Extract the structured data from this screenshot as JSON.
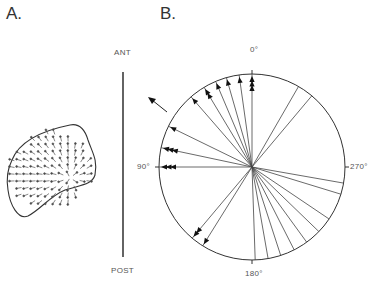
{
  "panels": {
    "a": {
      "label": "A."
    },
    "b": {
      "label": "B."
    }
  },
  "axis": {
    "anterior_label": "ANT",
    "posterior_label": "POST"
  },
  "polar": {
    "labels": {
      "top": "0°",
      "left": "90°",
      "bottom": "180°",
      "right": "270°"
    },
    "center": [
      252,
      167
    ],
    "radius": 93,
    "arrowed_directions_deg": [
      {
        "angle": 0,
        "heads": 3
      },
      {
        "angle": 8,
        "heads": 1
      },
      {
        "angle": 16,
        "heads": 1
      },
      {
        "angle": 23,
        "heads": 1
      },
      {
        "angle": 31,
        "heads": 2
      },
      {
        "angle": 41,
        "heads": 1
      },
      {
        "angle": 64,
        "heads": 1
      },
      {
        "angle": 78,
        "heads": 3
      },
      {
        "angle": 90,
        "heads": 3
      },
      {
        "angle": 140,
        "heads": 2
      },
      {
        "angle": 148,
        "heads": 1
      }
    ],
    "plain_directions_deg": [
      182,
      190,
      198,
      207,
      216,
      226,
      236,
      253,
      260,
      320,
      330
    ]
  },
  "mean_vector": {
    "angle_deg": 57,
    "description": "outside arrow pointing up-left"
  }
}
